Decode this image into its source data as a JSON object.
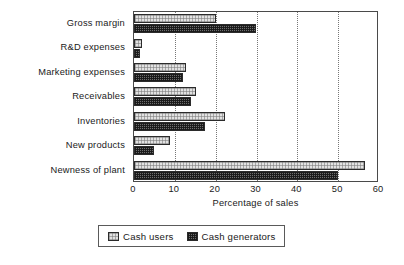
{
  "chart_data": {
    "type": "bar",
    "orientation": "horizontal",
    "title": "",
    "xlabel": "Percentage of sales",
    "ylabel": "",
    "xlim": [
      0,
      60
    ],
    "xticks": [
      0,
      10,
      20,
      30,
      40,
      50,
      60
    ],
    "xtick_labels": [
      "0",
      "10",
      "20",
      "30",
      "40",
      "50",
      "60"
    ],
    "grid": "vertical-dotted",
    "legend_position": "below-axis-center",
    "categories": [
      "Gross margin",
      "R&D expenses",
      "Marketing expenses",
      "Receivables",
      "Inventories",
      "New products",
      "Newness of plant"
    ],
    "series": [
      {
        "name": "Cash users",
        "fill": "light-hatch",
        "color": "#e2e2e2",
        "values": [
          20.0,
          2.0,
          12.7,
          15.2,
          22.3,
          8.8,
          56.6
        ]
      },
      {
        "name": "Cash generators",
        "fill": "dark-checker",
        "color": "#6d6d6d",
        "values": [
          29.9,
          1.5,
          12.0,
          14.0,
          17.4,
          4.9,
          50.0
        ]
      }
    ]
  },
  "legend": {
    "entries": [
      {
        "label": "Cash users"
      },
      {
        "label": "Cash generators"
      }
    ]
  },
  "axis": {
    "x_axis_title": "Percentage of sales"
  }
}
